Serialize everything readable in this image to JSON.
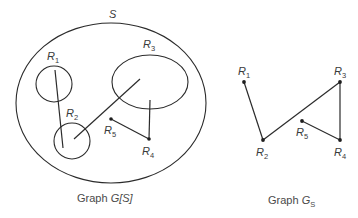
{
  "left_diagram": {
    "set_label": "S",
    "caption_prefix": "Graph ",
    "caption_var": "G",
    "caption_suffix": "[S]",
    "regions": [
      {
        "id": "R1",
        "letter": "R",
        "index": "1",
        "shape": "circle"
      },
      {
        "id": "R2",
        "letter": "R",
        "index": "2",
        "shape": "circle"
      },
      {
        "id": "R3",
        "letter": "R",
        "index": "3",
        "shape": "ellipse"
      },
      {
        "id": "R4",
        "letter": "R",
        "index": "4",
        "shape": "point"
      },
      {
        "id": "R5",
        "letter": "R",
        "index": "5",
        "shape": "point"
      }
    ],
    "edges": [
      [
        "R1",
        "R2"
      ],
      [
        "R2",
        "R3"
      ],
      [
        "R3",
        "R4"
      ],
      [
        "R4",
        "R5"
      ]
    ]
  },
  "right_diagram": {
    "caption_prefix": "Graph ",
    "caption_var": "G",
    "caption_sub": "S",
    "nodes": [
      {
        "id": "R1",
        "letter": "R",
        "index": "1"
      },
      {
        "id": "R2",
        "letter": "R",
        "index": "2"
      },
      {
        "id": "R3",
        "letter": "R",
        "index": "3"
      },
      {
        "id": "R4",
        "letter": "R",
        "index": "4"
      },
      {
        "id": "R5",
        "letter": "R",
        "index": "5"
      }
    ],
    "edges": [
      [
        "R1",
        "R2"
      ],
      [
        "R2",
        "R3"
      ],
      [
        "R3",
        "R4"
      ],
      [
        "R4",
        "R5"
      ]
    ]
  },
  "colors": {
    "line": "#2b2b2b",
    "text": "#3a3a3a",
    "background": "#ffffff"
  }
}
